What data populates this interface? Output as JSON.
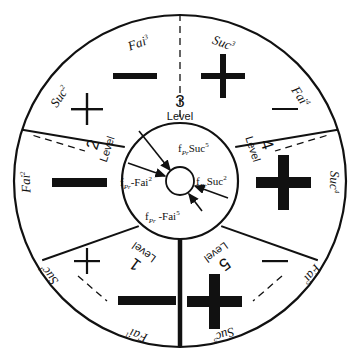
{
  "diagram": {
    "center": {
      "labels": [
        {
          "id": "top",
          "base": "f",
          "sub": "Pr",
          "term": "Suc",
          "sup": "5",
          "sign": "",
          "text": "fPrSuc5"
        },
        {
          "id": "left",
          "base": "f",
          "sub": "Pr",
          "term": "Fai",
          "sup": "2",
          "sign": "-",
          "text": "fPr-Fai2"
        },
        {
          "id": "right",
          "base": "f",
          "sub": "Pr",
          "term": "Suc",
          "sup": "2",
          "sign": "",
          "text": "fPrSuc2"
        },
        {
          "id": "bottom",
          "base": "f",
          "sub": "Pr",
          "term": "Fai",
          "sup": "5",
          "sign": "-",
          "text": "fPr -Fai5"
        }
      ],
      "arrow_count": 4
    },
    "level_word": "Level",
    "sectors": [
      {
        "level": "1",
        "fail_label": "Fai",
        "fail_sup": "1",
        "succ_label": "Suc",
        "succ_sup": "1",
        "fail_sign": "minus",
        "fail_weight": "heavy",
        "succ_sign": "plus",
        "succ_weight": "light"
      },
      {
        "level": "2",
        "fail_label": "Fai",
        "fail_sup": "2",
        "succ_label": "Suc",
        "succ_sup": "2",
        "fail_sign": "minus",
        "fail_weight": "heavy",
        "succ_sign": "plus",
        "succ_weight": "light"
      },
      {
        "level": "3",
        "fail_label": "Fai",
        "fail_sup": "3",
        "succ_label": "Suc",
        "succ_sup": "3",
        "fail_sign": "minus",
        "fail_weight": "medium",
        "succ_sign": "plus",
        "succ_weight": "medium"
      },
      {
        "level": "4",
        "fail_label": "Fai",
        "fail_sup": "4",
        "succ_label": "Suc",
        "succ_sup": "4",
        "fail_sign": "minus",
        "fail_weight": "light",
        "succ_sign": "plus",
        "succ_weight": "heavy"
      },
      {
        "level": "5",
        "fail_label": "Fai",
        "fail_sup": "5",
        "succ_label": "Suc",
        "succ_sup": "5",
        "fail_sign": "minus",
        "fail_weight": "light",
        "succ_sign": "plus",
        "succ_weight": "heavy"
      }
    ],
    "colors": {
      "stroke": "#111111",
      "fill": "#ffffff",
      "symbol": "#111111"
    }
  }
}
